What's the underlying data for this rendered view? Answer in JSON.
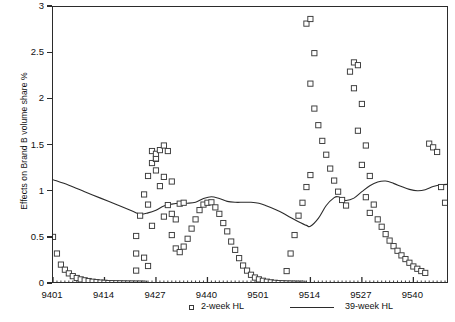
{
  "chart_data": {
    "type": "scatter",
    "title": "",
    "xlabel": "",
    "ylabel": "Effects on Brand B volume share %",
    "ylim": [
      0,
      3
    ],
    "yticks": [
      0,
      0.5,
      1,
      1.5,
      2,
      2.5,
      3
    ],
    "ytick_labels": [
      "0",
      "0.5",
      "1",
      "1.5",
      "2",
      "2.5",
      "3"
    ],
    "xlim": [
      9401,
      9552
    ],
    "xtick_labels": [
      "9401",
      "9414",
      "9427",
      "9440",
      "9501",
      "9514",
      "9527",
      "9540"
    ],
    "xtick_index": [
      0,
      13,
      26,
      39,
      52,
      65,
      78,
      91
    ],
    "x_minor_ticks": true,
    "grid": false,
    "legend_position": "bottom",
    "series": [
      {
        "name": "2-week HL",
        "type": "scatter",
        "marker": "open-square",
        "color": "#3a3a3a",
        "points": [
          [
            0,
            0.51
          ],
          [
            1,
            0.33
          ],
          [
            2,
            0.21
          ],
          [
            3,
            0.155
          ],
          [
            4,
            0.115
          ],
          [
            5,
            0.085
          ],
          [
            6,
            0.065
          ],
          [
            7,
            0.05
          ],
          [
            8,
            0.04
          ],
          [
            9,
            0.032
          ],
          [
            10,
            0.025
          ],
          [
            11,
            0.02
          ],
          [
            12,
            0.016
          ],
          [
            13,
            0.013
          ],
          [
            14,
            0.01
          ],
          [
            15,
            0.009
          ],
          [
            16,
            0.008
          ],
          [
            17,
            0.007
          ],
          [
            18,
            0.006
          ],
          [
            19,
            0.005
          ],
          [
            20,
            0.005
          ],
          [
            21,
            0.004
          ],
          [
            22,
            0.004
          ],
          [
            23,
            0.003
          ],
          [
            21,
            0.145
          ],
          [
            21,
            0.33
          ],
          [
            21,
            0.52
          ],
          [
            22,
            0.74
          ],
          [
            23,
            0.97
          ],
          [
            24,
            1.17
          ],
          [
            25,
            1.31
          ],
          [
            26,
            1.355
          ],
          [
            26,
            1.36
          ],
          [
            25,
            1.44
          ],
          [
            26,
            1.41
          ],
          [
            24,
            0.86
          ],
          [
            25,
            0.63
          ],
          [
            26,
            1.23
          ],
          [
            27,
            1.06
          ],
          [
            28,
            0.73
          ],
          [
            23,
            0.285
          ],
          [
            24,
            0.195
          ],
          [
            27,
            1.45
          ],
          [
            28,
            1.5
          ],
          [
            29,
            1.44
          ],
          [
            28,
            1.16
          ],
          [
            30,
            1.11
          ],
          [
            29,
            0.855
          ],
          [
            30,
            0.76
          ],
          [
            31,
            0.7
          ],
          [
            32,
            0.87
          ],
          [
            33,
            0.88
          ],
          [
            30,
            0.53
          ],
          [
            31,
            0.385
          ],
          [
            32,
            0.345
          ],
          [
            33,
            0.405
          ],
          [
            34,
            0.49
          ],
          [
            35,
            0.6
          ],
          [
            36,
            0.7
          ],
          [
            37,
            0.8
          ],
          [
            38,
            0.86
          ],
          [
            39,
            0.88
          ],
          [
            40,
            0.885
          ],
          [
            41,
            0.83
          ],
          [
            42,
            0.76
          ],
          [
            43,
            0.66
          ],
          [
            44,
            0.57
          ],
          [
            45,
            0.46
          ],
          [
            46,
            0.37
          ],
          [
            47,
            0.28
          ],
          [
            48,
            0.2
          ],
          [
            49,
            0.145
          ],
          [
            50,
            0.1
          ],
          [
            51,
            0.07
          ],
          [
            52,
            0.05
          ],
          [
            53,
            0.035
          ],
          [
            54,
            0.025
          ],
          [
            55,
            0.018
          ],
          [
            56,
            0.013
          ],
          [
            57,
            0.01
          ],
          [
            58,
            0.008
          ],
          [
            59,
            0.006
          ],
          [
            60,
            0.005
          ],
          [
            61,
            0.004
          ],
          [
            62,
            0.003
          ],
          [
            63,
            0.003
          ],
          [
            59,
            0.14
          ],
          [
            60,
            0.33
          ],
          [
            61,
            0.53
          ],
          [
            62,
            0.74
          ],
          [
            63,
            0.88
          ],
          [
            64,
            1.05
          ],
          [
            65,
            1.18
          ],
          [
            64,
            2.82
          ],
          [
            65,
            2.87
          ],
          [
            66,
            2.5
          ],
          [
            65,
            2.17
          ],
          [
            66,
            1.9
          ],
          [
            67,
            1.72
          ],
          [
            68,
            1.55
          ],
          [
            69,
            1.4
          ],
          [
            70,
            1.25
          ],
          [
            71,
            1.12
          ],
          [
            72,
            1.0
          ],
          [
            73,
            0.91
          ],
          [
            74,
            0.85
          ],
          [
            75,
            2.3
          ],
          [
            76,
            2.4
          ],
          [
            77,
            2.37
          ],
          [
            76,
            2.12
          ],
          [
            78,
            1.95
          ],
          [
            77,
            1.66
          ],
          [
            79,
            1.5
          ],
          [
            78,
            1.29
          ],
          [
            80,
            1.17
          ],
          [
            79,
            0.94
          ],
          [
            81,
            0.86
          ],
          [
            80,
            0.77
          ],
          [
            82,
            0.7
          ],
          [
            83,
            0.62
          ],
          [
            84,
            0.54
          ],
          [
            85,
            0.47
          ],
          [
            86,
            0.41
          ],
          [
            87,
            0.36
          ],
          [
            88,
            0.31
          ],
          [
            89,
            0.27
          ],
          [
            90,
            0.23
          ],
          [
            91,
            0.19
          ],
          [
            92,
            0.165
          ],
          [
            93,
            0.14
          ],
          [
            94,
            0.12
          ],
          [
            95,
            1.52
          ],
          [
            96,
            1.48
          ],
          [
            97,
            1.43
          ],
          [
            98,
            1.05
          ],
          [
            99,
            0.88
          ]
        ]
      },
      {
        "name": "39-week HL",
        "type": "line",
        "color": "#2b2b2b",
        "points": [
          [
            0,
            1.13
          ],
          [
            4,
            1.07
          ],
          [
            8,
            1.0
          ],
          [
            12,
            0.93
          ],
          [
            16,
            0.86
          ],
          [
            20,
            0.79
          ],
          [
            22,
            0.755
          ],
          [
            24,
            0.77
          ],
          [
            26,
            0.8
          ],
          [
            28,
            0.845
          ],
          [
            30,
            0.865
          ],
          [
            32,
            0.875
          ],
          [
            34,
            0.875
          ],
          [
            36,
            0.885
          ],
          [
            38,
            0.925
          ],
          [
            40,
            0.945
          ],
          [
            42,
            0.925
          ],
          [
            44,
            0.895
          ],
          [
            46,
            0.885
          ],
          [
            48,
            0.885
          ],
          [
            50,
            0.885
          ],
          [
            52,
            0.875
          ],
          [
            54,
            0.845
          ],
          [
            56,
            0.81
          ],
          [
            58,
            0.77
          ],
          [
            60,
            0.72
          ],
          [
            62,
            0.675
          ],
          [
            64,
            0.635
          ],
          [
            65,
            0.625
          ],
          [
            67,
            0.71
          ],
          [
            69,
            0.85
          ],
          [
            71,
            0.935
          ],
          [
            72,
            0.945
          ],
          [
            73,
            0.925
          ],
          [
            74,
            0.905
          ],
          [
            76,
            0.93
          ],
          [
            78,
            1.0
          ],
          [
            80,
            1.065
          ],
          [
            82,
            1.105
          ],
          [
            84,
            1.115
          ],
          [
            86,
            1.09
          ],
          [
            88,
            1.055
          ],
          [
            90,
            1.025
          ],
          [
            92,
            1.01
          ],
          [
            94,
            1.02
          ],
          [
            96,
            1.055
          ],
          [
            98,
            1.075
          ],
          [
            100,
            1.08
          ]
        ]
      }
    ]
  },
  "legend": {
    "items": [
      {
        "label": "2-week HL",
        "marker": "open-square"
      },
      {
        "label": "39-week HL",
        "marker": "line"
      }
    ]
  }
}
